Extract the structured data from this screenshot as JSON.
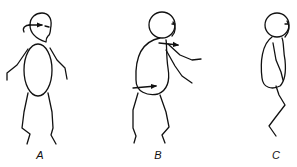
{
  "figures": [
    {
      "id": "A",
      "label": "A",
      "label_x": 40,
      "description": "upright stick figure with arrow at head"
    },
    {
      "id": "B",
      "label": "B",
      "label_x": 158,
      "description": "forward-leaning stick figure with arrows at shoulder and hip"
    },
    {
      "id": "C",
      "label": "C",
      "label_x": 276,
      "description": "side-profile stick figure with bent knee"
    }
  ],
  "colors": {
    "stroke": "#111111",
    "background": "#ffffff"
  }
}
